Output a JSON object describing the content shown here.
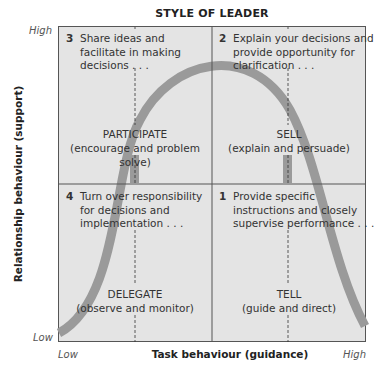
{
  "title": "STYLE OF LEADER",
  "axes": {
    "y_label": "Relationship behaviour (support)",
    "x_label": "Task behaviour (guidance)",
    "y_high": "High",
    "y_low": "Low",
    "x_low": "Low",
    "x_high": "High"
  },
  "quadrants": [
    {
      "number": "3",
      "lines": [
        "Share ideas and",
        "facilitate in making",
        "decisions . . ."
      ],
      "style": "PARTICIPATE",
      "style_desc": "(encourage and problem solve)"
    },
    {
      "number": "2",
      "lines": [
        "Explain your decisions and",
        "provide opportunity for",
        "clarification . . ."
      ],
      "style": "SELL",
      "style_desc": "(explain and persuade)"
    },
    {
      "number": "4",
      "lines": [
        "Turn over responsibility",
        "for decisions and",
        "implementation . . ."
      ],
      "style": "DELEGATE",
      "style_desc": "(observe and monitor)"
    },
    {
      "number": "1",
      "lines": [
        "Provide specific",
        "instructions and closely",
        "supervise performance . . ."
      ],
      "style": "TELL",
      "style_desc": "(guide and direct)"
    }
  ],
  "colors": {
    "background": "#e4e4e4",
    "curve": "#9a9a9a",
    "border": "#555555"
  }
}
